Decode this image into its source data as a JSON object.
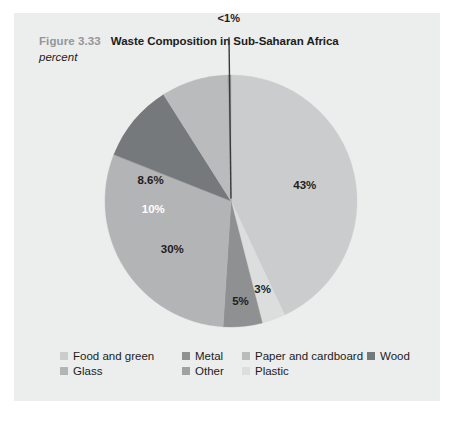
{
  "figure": {
    "number": "Figure 3.33",
    "title": "Waste Composition in Sub-Saharan Africa",
    "subtitle": "percent"
  },
  "colors": {
    "panel_background": "#eceded",
    "page_background": "#ffffff",
    "figure_number": "#949698",
    "title_text": "#1c1c1c",
    "food_and_green": "#cacccd",
    "metal": "#8e9092",
    "paper_and_cardboard": "#b9bbbc",
    "wood": "#76797b",
    "glass": "#b2b4b6",
    "other": "#9fa1a3",
    "plastic": "#dcdddd",
    "leader_line": "#3a3a3a"
  },
  "chart_data": {
    "type": "pie",
    "title": "Waste Composition in Sub-Saharan Africa",
    "subtitle": "percent",
    "unit": "percent",
    "legend_position": "bottom",
    "start_angle_deg": 0,
    "direction": "clockwise",
    "slices": [
      {
        "name": "Food and green",
        "value": 43,
        "label": "43%",
        "color": "#cacccd",
        "label_color": "dark",
        "label_r": 0.6,
        "label_mid_deg": 77.4
      },
      {
        "name": "Plastic",
        "value": 3,
        "label": "3%",
        "color": "#dcdddd",
        "label_color": "dark",
        "label_r": 0.74,
        "label_mid_deg": 160.2
      },
      {
        "name": "Metal",
        "value": 5,
        "label": "5%",
        "color": "#8e9092",
        "label_color": "dark",
        "label_r": 0.8,
        "label_mid_deg": 174.6
      },
      {
        "name": "Glass",
        "value": 30,
        "label": "30%",
        "color": "#b2b4b6",
        "label_color": "dark",
        "label_r": 0.6,
        "label_mid_deg": 231.0
      },
      {
        "name": "Wood",
        "value": 10,
        "label": "10%",
        "color": "#76797b",
        "label_color": "light",
        "label_r": 0.62,
        "label_mid_deg": 264.1
      },
      {
        "name": "Paper and cardboard",
        "value": 8.6,
        "label": "8.6%",
        "color": "#b9bbbc",
        "label_color": "dark",
        "label_r": 0.66,
        "label_mid_deg": 284.6
      },
      {
        "name": "Other",
        "value": 0.4,
        "label": "<1%",
        "color": "#9fa1a3",
        "label_color": "dark",
        "label_r": 1.45,
        "label_mid_deg": 359.3,
        "callout": true
      }
    ]
  },
  "legend": {
    "rows": [
      [
        {
          "label": "Food and green",
          "color": "#cacccd",
          "x": 0
        },
        {
          "label": "Metal",
          "color": "#8e9092",
          "x": 122
        },
        {
          "label": "Paper and cardboard",
          "color": "#b9bbbc",
          "x": 182
        },
        {
          "label": "Wood",
          "color": "#76797b",
          "x": 307
        }
      ],
      [
        {
          "label": "Glass",
          "color": "#b2b4b6",
          "x": 0
        },
        {
          "label": "Other",
          "color": "#9fa1a3",
          "x": 122
        },
        {
          "label": "Plastic",
          "color": "#dcdddd",
          "x": 182
        }
      ]
    ]
  }
}
